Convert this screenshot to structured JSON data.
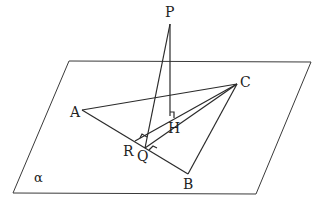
{
  "diagram": {
    "plane_label": "α",
    "points": {
      "P": {
        "label": "P",
        "x": 170,
        "y": 24
      },
      "A": {
        "label": "A",
        "x": 82,
        "y": 110
      },
      "B": {
        "label": "B",
        "x": 188,
        "y": 174
      },
      "C": {
        "label": "C",
        "x": 237,
        "y": 84
      },
      "H": {
        "label": "H",
        "x": 170,
        "y": 116
      },
      "Q": {
        "label": "Q",
        "x": 145,
        "y": 148
      },
      "R": {
        "label": "R",
        "x": 135,
        "y": 141
      }
    },
    "plane_corners": [
      [
        69,
        61
      ],
      [
        311,
        62
      ],
      [
        256,
        194
      ],
      [
        13,
        193
      ]
    ],
    "segments": [
      "AB",
      "BC",
      "CA",
      "PH",
      "PQ",
      "RC",
      "QC"
    ],
    "right_angles": [
      "PHQ (at H)",
      "PQ⊥AB (at Q)",
      "RC⊥AB (at R)"
    ],
    "colors": {
      "line": "#2a2a2a",
      "background": "#ffffff"
    }
  }
}
